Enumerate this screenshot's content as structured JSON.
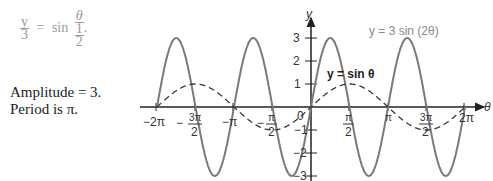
{
  "formula": {
    "lhs_num": "y",
    "lhs_den": "3",
    "eq": "=",
    "func": "sin",
    "arg_num": "θ",
    "arg_den_num": "1",
    "arg_den_den": "2",
    "end": "."
  },
  "notes": {
    "line1": "Amplitude = 3.",
    "line2": "Period is π."
  },
  "labels": {
    "curve_a": "y = 3 sin (2θ)",
    "curve_b": "y = sin θ",
    "x_axis": "θ",
    "y_axis": "y",
    "origin": "0"
  },
  "chart_data": {
    "type": "line",
    "title": "",
    "xlabel": "θ",
    "ylabel": "y",
    "xlim": [
      "-2π",
      "2π"
    ],
    "ylim": [
      -3,
      3
    ],
    "x_ticks": [
      "-2π",
      "-3π/2",
      "-π",
      "-π/2",
      "0",
      "π/2",
      "π",
      "3π/2",
      "2π"
    ],
    "y_ticks": [
      -3,
      -2,
      -1,
      1,
      2,
      3
    ],
    "series": [
      {
        "name": "y = 3 sin (2θ)",
        "style": "solid",
        "color": "#7a7a7a",
        "amplitude": 3,
        "period": "π",
        "formula": "3*sin(2θ)"
      },
      {
        "name": "y = sin θ",
        "style": "dashed",
        "color": "#333333",
        "amplitude": 1,
        "period": "2π",
        "formula": "sin(θ)"
      }
    ],
    "annotations": [
      "y/3 = sin(θ/(1/2))",
      "Amplitude = 3.",
      "Period is π."
    ],
    "grid": false,
    "legend": "inline labels"
  }
}
